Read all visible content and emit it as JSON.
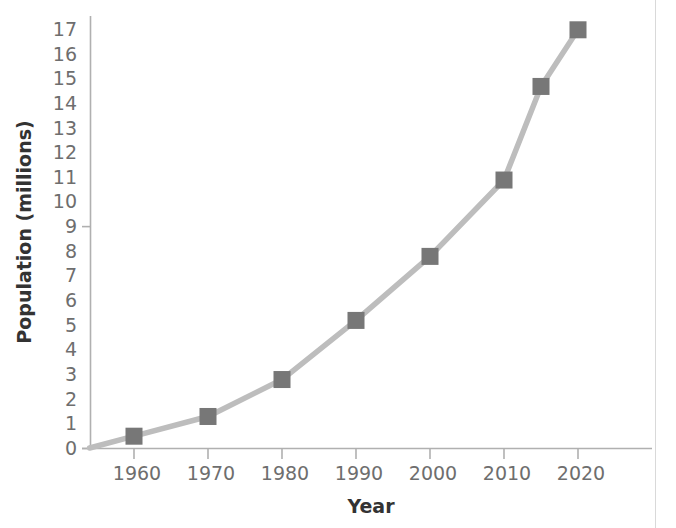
{
  "chart_data": {
    "type": "line",
    "title": "",
    "xlabel": "Year",
    "ylabel": "Population (millions)",
    "x": [
      1960,
      1970,
      1980,
      1990,
      2000,
      2010,
      2015,
      2020
    ],
    "values": [
      0.5,
      1.3,
      2.8,
      5.2,
      7.8,
      10.9,
      14.7,
      17.0
    ],
    "series": [
      {
        "name": "Population",
        "x": [
          1960,
          1970,
          1980,
          1990,
          2000,
          2010,
          2015,
          2020
        ],
        "values": [
          0.5,
          1.3,
          2.8,
          5.2,
          7.8,
          10.9,
          14.7,
          17.0
        ]
      }
    ],
    "xlim": [
      1954,
      2024
    ],
    "ylim": [
      0,
      17.6
    ],
    "xticks": [
      1960,
      1970,
      1980,
      1990,
      2000,
      2010,
      2020
    ],
    "xtick_labels": [
      "1960",
      "1970",
      "1980",
      "1990",
      "2000",
      "2010",
      "2020"
    ],
    "yticks": [
      0,
      1,
      2,
      3,
      4,
      5,
      6,
      7,
      8,
      9,
      10,
      11,
      12,
      13,
      14,
      15,
      16,
      17
    ],
    "ytick_labels": [
      "0",
      "1",
      "2",
      "3",
      "4",
      "5",
      "6",
      "7",
      "8",
      "9",
      "10",
      "11",
      "12",
      "13",
      "14",
      "15",
      "16",
      "17"
    ],
    "grid": false,
    "legend": null,
    "marker": "square",
    "line_color": "#b8b8b8",
    "marker_color": "#777777",
    "axis_color": "#b0b0b0",
    "tick_label_color": "#6e6e6e",
    "axis_title_color": "#333333"
  },
  "axes": {
    "x_title": "Year",
    "y_title": "Population (millions)"
  },
  "yticks": {
    "t17": "17",
    "t16": "16",
    "t15": "15",
    "t14": "14",
    "t13": "13",
    "t12": "12",
    "t11": "11",
    "t10": "10",
    "t9": "9",
    "t8": "8",
    "t7": "7",
    "t6": "6",
    "t5": "5",
    "t4": "4",
    "t3": "3",
    "t2": "2",
    "t1": "1",
    "t0": "0"
  },
  "xticks": {
    "x1960": "1960",
    "x1970": "1970",
    "x1980": "1980",
    "x1990": "1990",
    "x2000": "2000",
    "x2010": "2010",
    "x2020": "2020"
  }
}
